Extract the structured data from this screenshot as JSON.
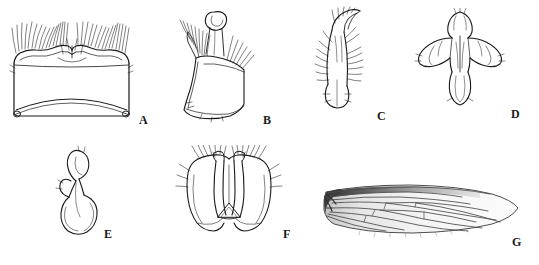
{
  "figure": {
    "type": "scientific-plate",
    "background_color": "#ffffff",
    "line_color": "#1a1a1a",
    "panel_count": 7,
    "panels": [
      {
        "id": "A",
        "label": "A",
        "name": "panel-a-tergite",
        "description": "Broad bilobed sclerite with dense marginal setae along upper edge"
      },
      {
        "id": "B",
        "label": "B",
        "name": "panel-b-gonocoxite",
        "description": "Elongate lateral sclerite with apical setal brush"
      },
      {
        "id": "C",
        "label": "C",
        "name": "panel-c-gonostylus",
        "description": "Narrow curved appendage with setae along inner margin"
      },
      {
        "id": "D",
        "label": "D",
        "name": "panel-d-aedeagal-complex",
        "description": "Symmetrical winged sclerite with median rod and rounded apex"
      },
      {
        "id": "E",
        "label": "E",
        "name": "panel-e-sperm-pump",
        "description": "Hook-shaped sclerite with bulbous basal expansion"
      },
      {
        "id": "F",
        "label": "F",
        "name": "panel-f-hypopygium",
        "description": "Symmetrical bilobed terminal structure with triangular median plate"
      },
      {
        "id": "G",
        "label": "G",
        "name": "panel-g-wing",
        "description": "Elongate wing with darkened costal margin and branching venation"
      }
    ]
  }
}
